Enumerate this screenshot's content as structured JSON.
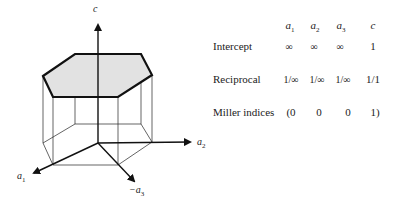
{
  "diagram": {
    "axes": {
      "c": {
        "label": "c"
      },
      "a1": {
        "label": "a",
        "sub": "1"
      },
      "a2": {
        "label": "a",
        "sub": "2"
      },
      "a3": {
        "label": "−a",
        "sub": "3"
      }
    },
    "colors": {
      "face_fill": "#e2e2e2",
      "stroke": "#111111"
    }
  },
  "table": {
    "columns": [
      {
        "label": "a",
        "sub": "1"
      },
      {
        "label": "a",
        "sub": "2"
      },
      {
        "label": "a",
        "sub": "3"
      },
      {
        "label": "c",
        "sub": ""
      }
    ],
    "rows": [
      {
        "label": "Intercept",
        "values": [
          "∞",
          "∞",
          "∞",
          "1"
        ]
      },
      {
        "label": "Reciprocal",
        "values": [
          "1/∞",
          "1/∞",
          "1/∞",
          "1/1"
        ]
      },
      {
        "label": "Miller indices",
        "values": [
          "(0",
          "0",
          "0",
          "1)"
        ]
      }
    ]
  }
}
